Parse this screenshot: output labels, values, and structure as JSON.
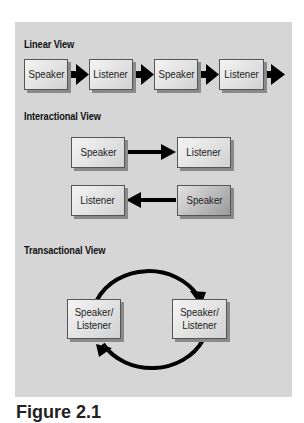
{
  "linear_view": {
    "heading": "Linear View",
    "nodes": [
      "Speaker",
      "Listener",
      "Speaker",
      "Listener"
    ]
  },
  "interactional_view": {
    "heading": "Interactional View",
    "row1": {
      "left": "Speaker",
      "right": "Listener"
    },
    "row2": {
      "left": "Listener",
      "right": "Speaker"
    }
  },
  "transactional_view": {
    "heading": "Transactional View",
    "left": "Speaker/ Listener",
    "right": "Speaker/ Listener"
  },
  "caption": "Figure 2.1",
  "colors": {
    "panel": "#d6d6d6",
    "arrow": "#000000"
  }
}
